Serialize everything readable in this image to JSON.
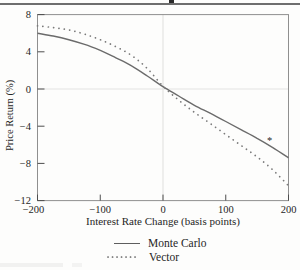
{
  "chart_data": {
    "type": "line",
    "title": "",
    "xlabel": "Interest Rate Change (basis points)",
    "ylabel": "Price Return (%)",
    "xlim": [
      -200,
      200
    ],
    "ylim": [
      -12,
      8
    ],
    "xticks": [
      -200,
      -100,
      0,
      100,
      200
    ],
    "xtick_labels": [
      "−200",
      "−100",
      "0",
      "100",
      "200"
    ],
    "yticks": [
      8,
      4,
      0,
      -4,
      -8,
      -12
    ],
    "ytick_labels": [
      "8",
      "4",
      "0",
      "−4",
      "−8",
      "−12"
    ],
    "grid": {
      "x_zero_line": true,
      "y_zero_line": true
    },
    "x": [
      -200,
      -175,
      -150,
      -125,
      -100,
      -75,
      -50,
      -25,
      0,
      25,
      50,
      75,
      100,
      125,
      150,
      175,
      200
    ],
    "series": [
      {
        "name": "Monte Carlo",
        "style": "solid",
        "color": "#6b6b6b",
        "values": [
          6.0,
          5.7,
          5.3,
          4.8,
          4.15,
          3.35,
          2.5,
          1.4,
          0.25,
          -0.75,
          -1.75,
          -2.6,
          -3.5,
          -4.4,
          -5.3,
          -6.3,
          -7.4
        ]
      },
      {
        "name": "Vector",
        "style": "dotted",
        "color": "#7a7a7a",
        "values": [
          6.8,
          6.6,
          6.35,
          5.9,
          5.3,
          4.55,
          3.6,
          2.2,
          0.3,
          -1.2,
          -2.5,
          -3.7,
          -4.9,
          -6.1,
          -7.3,
          -8.7,
          -10.4
        ]
      }
    ],
    "annotations": [
      {
        "symbol": "*",
        "x": 170,
        "y": -5.5
      }
    ],
    "legend_position": "bottom-center"
  },
  "legend": {
    "items": [
      {
        "label": "Monte Carlo",
        "style": "solid"
      },
      {
        "label": "Vector",
        "style": "dotted"
      }
    ]
  }
}
